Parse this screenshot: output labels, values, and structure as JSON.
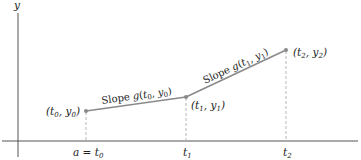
{
  "diagram": {
    "axes": {
      "y_label": "y",
      "x_ticks": [
        {
          "label": "a = t",
          "sub": "0",
          "x": 86
        },
        {
          "label": "t",
          "sub": "1",
          "x": 186
        },
        {
          "label": "t",
          "sub": "2",
          "x": 286
        }
      ]
    },
    "points": [
      {
        "name": "p0",
        "label": "(t0, y0)",
        "x": 86,
        "y": 111
      },
      {
        "name": "p1",
        "label": "(t1, y1)",
        "x": 186,
        "y": 97
      },
      {
        "name": "p2",
        "label": "(t2, y2)",
        "x": 286,
        "y": 50
      }
    ],
    "segments": [
      {
        "label": "Slope g(t0, y0)"
      },
      {
        "label": "Slope g(t1, y1)"
      }
    ],
    "colors": {
      "line": "#8a8a8a",
      "axis": "#555555",
      "dashed": "#b5b5b5",
      "point": "#8a8a8a"
    }
  }
}
